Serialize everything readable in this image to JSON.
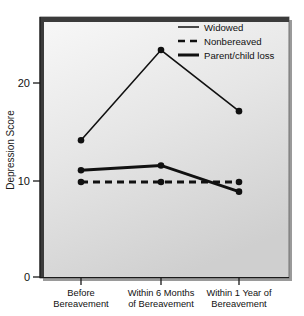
{
  "chart_data": {
    "type": "line",
    "title": "",
    "xlabel": "",
    "ylabel": "Depression Score",
    "categories": [
      "Before\nBereavement",
      "Within 6 Months\nof Bereavement",
      "Within 1 Year of\nBereavement"
    ],
    "category_lines": [
      [
        "Before",
        "Bereavement"
      ],
      [
        "Within 6 Months",
        "of Bereavement"
      ],
      [
        "Within 1 Year of",
        "Bereavement"
      ]
    ],
    "ylim": [
      0,
      26
    ],
    "yticks": [
      0,
      10,
      20
    ],
    "ytick_labels": [
      "0",
      "10",
      "20"
    ],
    "grid": false,
    "legend_position": "top-right",
    "series": [
      {
        "name": "Widowed",
        "style": "thin-solid",
        "values": [
          14.1,
          23.4,
          17.1
        ]
      },
      {
        "name": "Nonbereaved",
        "style": "dashed",
        "values": [
          9.8,
          9.8,
          9.8
        ]
      },
      {
        "name": "Parent/child loss",
        "style": "thick-solid",
        "values": [
          11.0,
          11.5,
          8.8
        ]
      }
    ],
    "colors": {
      "line": "#111111",
      "marker": "#111111",
      "plot_background_top": "#f4f4f4",
      "plot_background_bottom": "#d4d4d4",
      "frame": "#3b3b3b",
      "page_background": "#ffffff"
    }
  }
}
